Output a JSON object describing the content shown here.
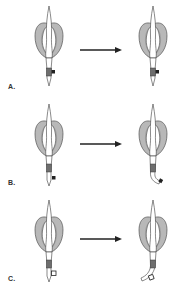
{
  "diagram": {
    "type": "before-after transformation sequence",
    "colors": {
      "outline": "#3a3a3a",
      "cuff_fill": "#b8b8b8",
      "cuff_inner": "#d9d9d9",
      "stem_fill": "#ffffff",
      "band_fill": "#6e6e6e",
      "marker_fill": "#222222",
      "arrow": "#222222",
      "background": "#ffffff"
    },
    "panels": [
      {
        "label": "A.",
        "marker": "filled-square",
        "after_shape": "straight"
      },
      {
        "label": "B.",
        "marker": "filled-square",
        "after_shape": "bent"
      },
      {
        "label": "C.",
        "marker": "open-square",
        "after_shape": "bent"
      }
    ]
  }
}
